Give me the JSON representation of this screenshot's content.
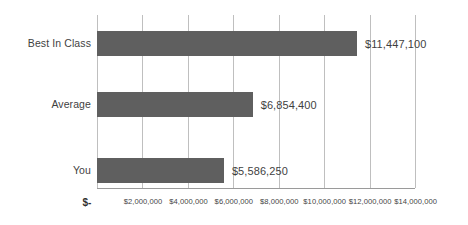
{
  "chart_data": {
    "type": "bar",
    "orientation": "horizontal",
    "title": "",
    "subtitle": "",
    "xlabel": "",
    "ylabel": "",
    "categories": [
      "Best In Class",
      "Average",
      "You"
    ],
    "values": [
      11447100,
      6854400,
      5586250
    ],
    "data_labels": [
      "$11,447,100",
      "$6,854,400",
      "$5,586,250"
    ],
    "series": [
      {
        "name": "",
        "values": [
          11447100,
          6854400,
          5586250
        ]
      }
    ],
    "xlim": [
      0,
      14000000
    ],
    "x_tick_values": [
      0,
      2000000,
      4000000,
      6000000,
      8000000,
      10000000,
      12000000,
      14000000
    ],
    "x_tick_labels": [
      "$-",
      "$2,000,000",
      "$4,000,000",
      "$6,000,000",
      "$8,000,000",
      "$10,000,000",
      "$12,000,000",
      "$14,000,000"
    ],
    "grid": true,
    "grid_axis": "x",
    "legend": false,
    "legend_position": "none",
    "annotations": [],
    "colors": {
      "bar_fill": "#5f5f5f",
      "gridline": "#bfbfbf",
      "axis_line": "#9a9a9a",
      "label_text": "#3f3f3f",
      "tick_text": "#454545",
      "background": "#ffffff"
    }
  }
}
